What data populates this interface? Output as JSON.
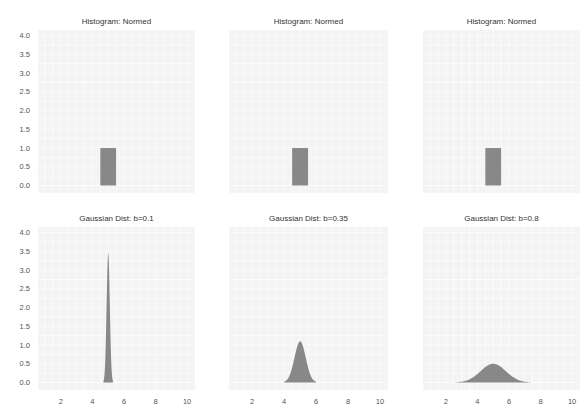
{
  "figure": {
    "layout": "2x3 grid of subplots",
    "background_color": "#ffffff",
    "axes_facecolor": "#f4f4f4",
    "grid_color": "#ffffff",
    "fill_color": "#888888"
  },
  "chart_data": [
    {
      "type": "bar",
      "title": "Histogram: Normed",
      "xlabel": "",
      "ylabel": "",
      "bins": [
        {
          "left": 4.5,
          "right": 5.5,
          "height": 1.0
        }
      ],
      "xlim": [
        0.55,
        10.5
      ],
      "ylim": [
        -0.2,
        4.15
      ],
      "yticks": [
        "0.0",
        "0.5",
        "1.0",
        "1.5",
        "2.0",
        "2.5",
        "3.0",
        "3.5",
        "4.0"
      ],
      "yticks_values": [
        0,
        0.5,
        1,
        1.5,
        2,
        2.5,
        3,
        3.5,
        4
      ],
      "xticks": [],
      "xticks_values": [],
      "show_yticks": true,
      "grid": true
    },
    {
      "type": "bar",
      "title": "Histogram: Normed",
      "xlabel": "",
      "ylabel": "",
      "bins": [
        {
          "left": 4.5,
          "right": 5.5,
          "height": 1.0
        }
      ],
      "xlim": [
        0.55,
        10.5
      ],
      "ylim": [
        -0.2,
        4.15
      ],
      "yticks": [],
      "yticks_values": [],
      "xticks": [],
      "xticks_values": [],
      "show_yticks": false,
      "grid": true
    },
    {
      "type": "bar",
      "title": "Histogram: Normed",
      "xlabel": "",
      "ylabel": "",
      "bins": [
        {
          "left": 4.5,
          "right": 5.5,
          "height": 1.0
        }
      ],
      "xlim": [
        0.55,
        10.5
      ],
      "ylim": [
        -0.2,
        4.15
      ],
      "yticks": [],
      "yticks_values": [],
      "xticks": [],
      "xticks_values": [],
      "show_yticks": false,
      "grid": true
    },
    {
      "type": "area",
      "title": "Gaussian Dist: b=0.1",
      "xlabel": "",
      "ylabel": "",
      "distribution": {
        "kind": "gaussian",
        "mean": 5.0,
        "sigma": 0.1,
        "peak": 3.45,
        "support": [
          4.7,
          5.3
        ]
      },
      "xlim": [
        0.55,
        10.5
      ],
      "ylim": [
        -0.2,
        4.15
      ],
      "yticks": [
        "0.0",
        "0.5",
        "1.0",
        "1.5",
        "2.0",
        "2.5",
        "3.0",
        "3.5",
        "4.0"
      ],
      "yticks_values": [
        0,
        0.5,
        1,
        1.5,
        2,
        2.5,
        3,
        3.5,
        4
      ],
      "xticks": [
        "2",
        "4",
        "6",
        "8",
        "10"
      ],
      "xticks_values": [
        2,
        4,
        6,
        8,
        10
      ],
      "show_yticks": true,
      "grid": true
    },
    {
      "type": "area",
      "title": "Gaussian Dist: b=0.35",
      "xlabel": "",
      "ylabel": "",
      "distribution": {
        "kind": "gaussian",
        "mean": 5.0,
        "sigma": 0.35,
        "peak": 1.1,
        "support": [
          4.0,
          6.0
        ]
      },
      "xlim": [
        0.55,
        10.5
      ],
      "ylim": [
        -0.2,
        4.15
      ],
      "yticks": [],
      "yticks_values": [],
      "xticks": [
        "2",
        "4",
        "6",
        "8",
        "10"
      ],
      "xticks_values": [
        2,
        4,
        6,
        8,
        10
      ],
      "show_yticks": false,
      "grid": true
    },
    {
      "type": "area",
      "title": "Gaussian Dist: b=0.8",
      "xlabel": "",
      "ylabel": "",
      "distribution": {
        "kind": "gaussian",
        "mean": 5.0,
        "sigma": 0.8,
        "peak": 0.5,
        "support": [
          2.6,
          7.4
        ]
      },
      "xlim": [
        0.55,
        10.5
      ],
      "ylim": [
        -0.2,
        4.15
      ],
      "yticks": [],
      "yticks_values": [],
      "xticks": [
        "2",
        "4",
        "6",
        "8",
        "10"
      ],
      "xticks_values": [
        2,
        4,
        6,
        8,
        10
      ],
      "show_yticks": false,
      "grid": true
    }
  ]
}
